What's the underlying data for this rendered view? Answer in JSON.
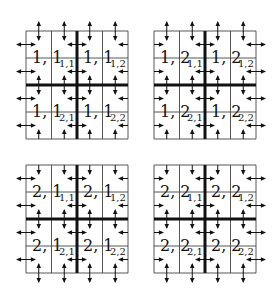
{
  "panels": [
    {
      "id": "1,1",
      "outer": {
        "top": "both",
        "left": "both",
        "right": "in",
        "bottom": "in"
      },
      "blocks": [
        {
          "main": "1, 1",
          "sub": "1,1"
        },
        {
          "main": "1, 1",
          "sub": "1,2"
        },
        {
          "main": "1, 1",
          "sub": "2,1"
        },
        {
          "main": "1, 1",
          "sub": "2,2"
        }
      ]
    },
    {
      "id": "1,2",
      "outer": {
        "top": "both",
        "left": "in",
        "right": "both",
        "bottom": "in"
      },
      "blocks": [
        {
          "main": "1, 2",
          "sub": "1,1"
        },
        {
          "main": "1, 2",
          "sub": "1,2"
        },
        {
          "main": "1, 2",
          "sub": "2,1"
        },
        {
          "main": "1, 2",
          "sub": "2,2"
        }
      ]
    },
    {
      "id": "2,1",
      "outer": {
        "top": "in",
        "left": "both",
        "right": "in",
        "bottom": "both"
      },
      "blocks": [
        {
          "main": "2, 1",
          "sub": "1,1"
        },
        {
          "main": "2, 1",
          "sub": "1,2"
        },
        {
          "main": "2, 1",
          "sub": "2,1"
        },
        {
          "main": "2, 1",
          "sub": "2,2"
        }
      ]
    },
    {
      "id": "2,2",
      "outer": {
        "top": "in",
        "left": "in",
        "right": "both",
        "bottom": "both"
      },
      "blocks": [
        {
          "main": "2, 2",
          "sub": "1,1"
        },
        {
          "main": "2, 2",
          "sub": "1,2"
        },
        {
          "main": "2, 2",
          "sub": "2,1"
        },
        {
          "main": "2, 2",
          "sub": "2,2"
        }
      ]
    }
  ]
}
